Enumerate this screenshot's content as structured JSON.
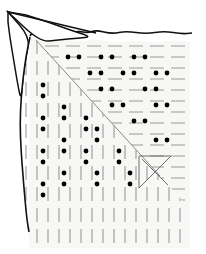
{
  "figure": {
    "title": "Folded sheet with dashed grid and paired dots",
    "type": "line-drawing",
    "width": 206,
    "height": 254,
    "background_color": "#ffffff"
  },
  "sheet": {
    "label": "paper-sheet",
    "fill_color": "#f7f7f5",
    "edge_color": "#111111",
    "edge_width": 1.6,
    "curled_corner_label": "curled-top-left-corner",
    "curled_corner_fill": "#ffffff",
    "outline_points": "30,36 34,30 40,33 52,38 64,35 78,31 88,33 96,30 112,34 126,31 146,34 164,31 182,34 192,33",
    "top_edge_points": "30,37 44,41 60,38 78,42 96,39 116,43 136,40 156,43 174,40 190,42",
    "left_edge_points": "30,37 26,56 23,78 21,100 20,124 21,150 23,176 25,200 27,220 29,232",
    "right_edge_x": 190,
    "bottom_edge_y": 248
  },
  "curl": {
    "label": "page-curl",
    "outer_points": "8,12 30,37 26,56 23,78 21,100 18,86 14,62 10,38 8,22",
    "inner_points": "8,12 40,42 58,40 78,38 92,37 70,30 48,22 26,15",
    "fold_line_points": "8,12 96,33",
    "stroke_color": "#111111",
    "stroke_width": 1.5,
    "fill_color": "#ffffff"
  },
  "diagonal": {
    "label": "main-diagonal",
    "from_x": 36,
    "from_y": 40,
    "to_x": 160,
    "to_y": 176,
    "stroke_color": "#8a8a8a",
    "stroke_width": 1.0,
    "description": "separates horizontal-dash region above from vertical-dash region below"
  },
  "pattern": {
    "dash_color": "#9a9a9a",
    "dash_width": 1.1,
    "dot_color": "#000000",
    "dot_radius": 2.4,
    "row_spacing": 11,
    "col_spacing": 11,
    "dash_length": 14,
    "upper_region": "horizontal dashes with horizontal dot pairs",
    "lower_region": "vertical dashes with vertical dot pairs"
  },
  "motif": {
    "label": "triangle-with-x",
    "triangle_points": "139,156 171,156 139,188",
    "cross_a": "142,159 168,185",
    "cross_b": "168,159 142,185",
    "stroke_color": "#6f6f6f",
    "stroke_width": 1.0
  },
  "chart_data": {
    "type": "scatter",
    "title": "Folded sheet with dashed grid and paired dots",
    "xlabel": "",
    "ylabel": "",
    "grid": true,
    "legend": "none",
    "xlim": [
      0,
      206
    ],
    "ylim": [
      0,
      254
    ],
    "series": [
      {
        "name": "upper-dot-pairs",
        "orientation": "horizontal",
        "points": [
          [
            68,
            57
          ],
          [
            79,
            57
          ],
          [
            101,
            57
          ],
          [
            112,
            57
          ],
          [
            134,
            57
          ],
          [
            145,
            57
          ],
          [
            90,
            73
          ],
          [
            101,
            73
          ],
          [
            123,
            73
          ],
          [
            134,
            73
          ],
          [
            156,
            73
          ],
          [
            167,
            73
          ],
          [
            101,
            89
          ],
          [
            112,
            89
          ],
          [
            145,
            89
          ],
          [
            156,
            89
          ],
          [
            112,
            105
          ],
          [
            123,
            105
          ],
          [
            156,
            105
          ],
          [
            167,
            105
          ],
          [
            134,
            121
          ],
          [
            145,
            121
          ],
          [
            156,
            140
          ],
          [
            167,
            140
          ]
        ]
      },
      {
        "name": "lower-dot-pairs",
        "orientation": "vertical",
        "points": [
          [
            43,
            85
          ],
          [
            43,
            96
          ],
          [
            43,
            118
          ],
          [
            43,
            129
          ],
          [
            43,
            151
          ],
          [
            43,
            162
          ],
          [
            43,
            184
          ],
          [
            43,
            195
          ],
          [
            64,
            107
          ],
          [
            64,
            118
          ],
          [
            64,
            140
          ],
          [
            64,
            151
          ],
          [
            64,
            173
          ],
          [
            64,
            184
          ],
          [
            86,
            118
          ],
          [
            86,
            129
          ],
          [
            86,
            151
          ],
          [
            86,
            162
          ],
          [
            97,
            129
          ],
          [
            97,
            140
          ],
          [
            97,
            173
          ],
          [
            97,
            184
          ],
          [
            119,
            151
          ],
          [
            119,
            162
          ],
          [
            130,
            173
          ],
          [
            130,
            184
          ]
        ]
      }
    ]
  }
}
